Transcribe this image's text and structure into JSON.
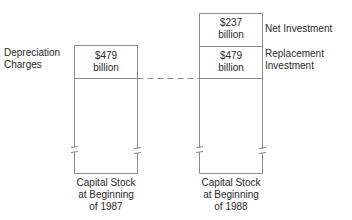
{
  "diagram": {
    "left_column": {
      "side_label": {
        "line1": "Depreciation",
        "line2": "Charges"
      },
      "box": {
        "value_line1": "$479",
        "value_line2": "billion"
      },
      "caption": {
        "line1": "Capital Stock",
        "line2": "at Beginning",
        "line3": "of 1987"
      }
    },
    "right_column": {
      "top_box": {
        "value_line1": "$237",
        "value_line2": "billion",
        "side_label": "Net Investment"
      },
      "middle_box": {
        "value_line1": "$479",
        "value_line2": "billion",
        "side_label_line1": "Replacement",
        "side_label_line2": "Investment"
      },
      "caption": {
        "line1": "Capital Stock",
        "line2": "at Beginning",
        "line3": "of 1988"
      }
    },
    "colors": {
      "line": "#7a7a7a",
      "text": "#2a2a2a"
    }
  }
}
